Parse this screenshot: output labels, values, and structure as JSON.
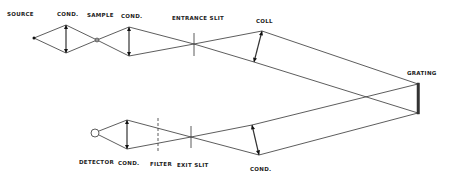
{
  "diagram": {
    "labels": {
      "source": "SOURCE",
      "cond_1": "COND.",
      "sample": "SAMPLE",
      "cond_2": "COND.",
      "entrance_slit": "ENTRANCE SLIT",
      "coll": "COLL",
      "grating": "GRATING",
      "detector": "DETECTOR",
      "cond_3": "COND.",
      "filter": "FILTER",
      "exit_slit": "EXIT SLIT",
      "cond_4": "COND."
    },
    "colors": {
      "line": "#333333",
      "background": "#ffffff"
    }
  }
}
